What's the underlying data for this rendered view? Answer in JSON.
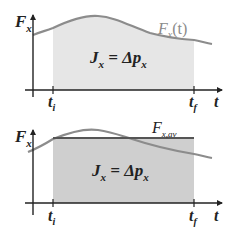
{
  "top_panel": {
    "y_axis_label": "F",
    "y_axis_sub": "x",
    "x_axis_label": "t",
    "curve_label": "F",
    "curve_label_sub": "x",
    "curve_label_arg": "(t)",
    "area_label_main": "J",
    "area_label_sub": "x",
    "area_label_eq": " = Δp",
    "area_label_sub2": "x",
    "tick_start": "t",
    "tick_start_sub": "i",
    "tick_end": "t",
    "tick_end_sub": "f"
  },
  "bottom_panel": {
    "y_axis_label": "F",
    "y_axis_sub": "x",
    "x_axis_label": "t",
    "avg_label": "F",
    "avg_label_sub": "x,av",
    "area_label_main": "J",
    "area_label_sub": "x",
    "area_label_eq": " = Δp",
    "area_label_sub2": "x",
    "tick_start": "t",
    "tick_start_sub": "i",
    "tick_end": "t",
    "tick_end_sub": "f"
  },
  "colors": {
    "axis": "#222222",
    "curve": "#8c8c8c",
    "shade_top": "#e6e6e6",
    "shade_bottom": "#cfcfcf",
    "avg_line": "#555555"
  }
}
